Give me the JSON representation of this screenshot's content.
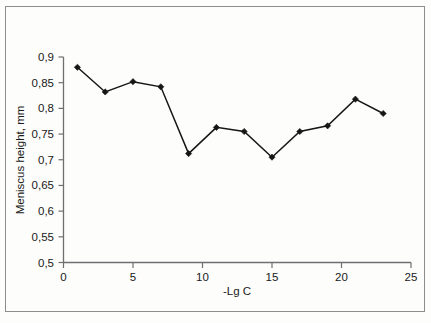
{
  "chart_data": {
    "type": "line",
    "title": "",
    "subtitle": "",
    "xlabel": "-Lg C",
    "ylabel": "Meniscus height, mm",
    "x": [
      1,
      3,
      5,
      7,
      9,
      11,
      13,
      15,
      17,
      19,
      21,
      23
    ],
    "values": [
      0.88,
      0.832,
      0.852,
      0.842,
      0.712,
      0.763,
      0.755,
      0.705,
      0.755,
      0.766,
      0.818,
      0.79
    ],
    "series": [
      {
        "name": "Meniscus height",
        "values": [
          0.88,
          0.832,
          0.852,
          0.842,
          0.712,
          0.763,
          0.755,
          0.705,
          0.755,
          0.766,
          0.818,
          0.79
        ]
      }
    ],
    "xlim": [
      0,
      25
    ],
    "ylim": [
      0.5,
      0.9
    ],
    "xticks": [
      0,
      5,
      10,
      15,
      20,
      25
    ],
    "yticks": [
      0.5,
      0.55,
      0.6,
      0.65,
      0.7,
      0.75,
      0.8,
      0.85,
      0.9
    ],
    "xtick_labels": [
      "0",
      "5",
      "10",
      "15",
      "20",
      "25"
    ],
    "ytick_labels": [
      "0,5",
      "0,55",
      "0,6",
      "0,65",
      "0,7",
      "0,75",
      "0,8",
      "0,85",
      "0,9"
    ],
    "decimal_separator": ",",
    "grid": false,
    "legend": false,
    "legend_position": "none",
    "marker": "diamond",
    "line_color": "#161616",
    "marker_color": "#161616",
    "axis_color": "#6f6f6f",
    "background_color": "#fdfdfc",
    "border_color": "#8d8d8d"
  }
}
